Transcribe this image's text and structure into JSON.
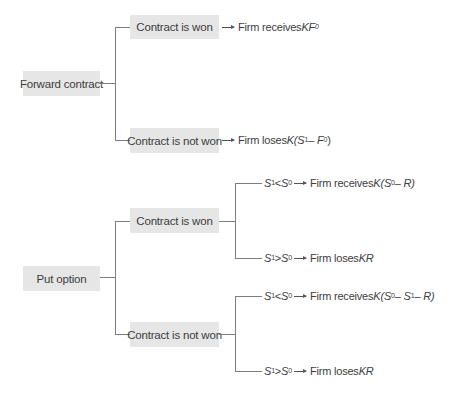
{
  "colors": {
    "box_fill": "#e6e6e6",
    "line": "#7d7d7d",
    "text": "#3d3d3d"
  },
  "forward": {
    "root": "Forward contract",
    "won": {
      "label": "Contract is won",
      "outcome_text": "Firm receives ",
      "outcome_math": "KF",
      "outcome_sub": "0"
    },
    "not_won": {
      "label": "Contract is not won",
      "outcome_text": "Firm loses ",
      "outcome_math": "K(S",
      "outcome_sub1": "1",
      "outcome_mid": " – F",
      "outcome_sub2": "0",
      "outcome_end": ")"
    }
  },
  "put": {
    "root": "Put option",
    "won": {
      "label": "Contract is won",
      "branches": [
        {
          "cond_a": "S",
          "cond_a_sub": "1",
          "op": " < ",
          "cond_b": "S",
          "cond_b_sub": "0",
          "outcome_text": "Firm receives ",
          "outcome_math": "K(S",
          "outcome_sub": "0",
          "outcome_end": " – R)"
        },
        {
          "cond_a": "S",
          "cond_a_sub": "1",
          "op": " > ",
          "cond_b": "S",
          "cond_b_sub": "0",
          "outcome_text": "Firm loses ",
          "outcome_math": "KR"
        }
      ]
    },
    "not_won": {
      "label": "Contract is not won",
      "branches": [
        {
          "cond_a": "S",
          "cond_a_sub": "1",
          "op": " < ",
          "cond_b": "S",
          "cond_b_sub": "0",
          "outcome_text": "Firm receives ",
          "outcome_math": "K(S",
          "outcome_sub": "0",
          "outcome_mid": " – S",
          "outcome_sub2": "1",
          "outcome_end": " – R)"
        },
        {
          "cond_a": "S",
          "cond_a_sub": "1",
          "op": " > ",
          "cond_b": "S",
          "cond_b_sub": "0",
          "outcome_text": "Firm loses ",
          "outcome_math": "KR"
        }
      ]
    }
  }
}
